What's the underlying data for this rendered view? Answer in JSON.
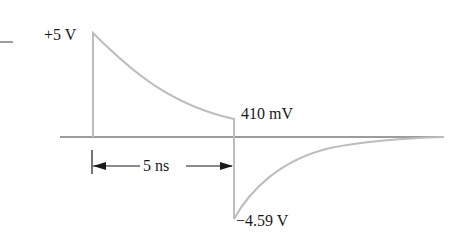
{
  "diagram": {
    "type": "waveform",
    "labels": {
      "peak_positive": "+5 V",
      "step_level": "410 mV",
      "duration": "5 ns",
      "peak_negative": "−4.59 V"
    },
    "colors": {
      "waveform": "#bdbdbd",
      "axis": "#3a3a3a",
      "annotation": "#1a1a1a",
      "background": "#ffffff"
    },
    "values": {
      "initial_voltage_V": 5,
      "voltage_before_transition_mV": 410,
      "negative_peak_V": -4.59,
      "pulse_width_ns": 5
    }
  }
}
